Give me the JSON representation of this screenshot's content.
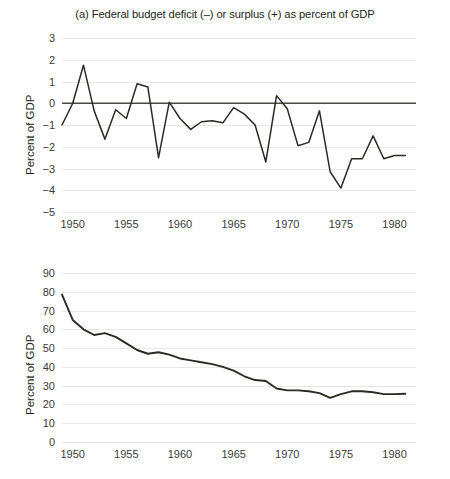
{
  "figure": {
    "panels": [
      {
        "id": "a",
        "title": "(a) Federal budget deficit (–) or surplus (+) as percent of GDP",
        "ylabel": "Percent of GDP"
      },
      {
        "id": "b",
        "title": "(b) National debt as percent of GDP",
        "ylabel": "Percent of GDP"
      }
    ]
  },
  "chart_data": [
    {
      "type": "line",
      "panel": "a",
      "title": "(a) Federal budget deficit (–) or surplus (+) as percent of GDP",
      "xlabel": "",
      "ylabel": "Percent of GDP",
      "xlim": [
        1949,
        1982
      ],
      "ylim": [
        -5,
        3
      ],
      "grid": true,
      "legend": "none",
      "yticks": [
        3,
        2,
        1,
        0,
        -1,
        -2,
        -3,
        -4,
        -5
      ],
      "yticklabels": [
        "3",
        "2",
        "1",
        "0",
        "−1",
        "−2",
        "−3",
        "−4",
        "−5"
      ],
      "xticks": [
        1950,
        1955,
        1960,
        1965,
        1970,
        1975,
        1980
      ],
      "xticklabels": [
        "1950",
        "1955",
        "1960",
        "1965",
        "1970",
        "1975",
        "1980"
      ],
      "annotations": [
        "zero reference line drawn at y = 0"
      ],
      "x": [
        1949,
        1950,
        1951,
        1952,
        1953,
        1954,
        1955,
        1956,
        1957,
        1958,
        1959,
        1960,
        1961,
        1962,
        1963,
        1964,
        1965,
        1966,
        1967,
        1968,
        1969,
        1970,
        1971,
        1972,
        1973,
        1974,
        1975,
        1976,
        1977,
        1978,
        1979,
        1980,
        1981
      ],
      "values": [
        -1.0,
        0.0,
        1.75,
        -0.35,
        -1.65,
        -0.3,
        -0.7,
        0.9,
        0.75,
        -2.5,
        0.05,
        -0.7,
        -1.2,
        -0.85,
        -0.8,
        -0.9,
        -0.2,
        -0.5,
        -1.0,
        -2.7,
        0.35,
        -0.25,
        -1.95,
        -1.8,
        -0.35,
        -3.15,
        -3.9,
        -2.55,
        -2.55,
        -1.5,
        -2.55,
        -2.4,
        -2.4
      ]
    },
    {
      "type": "line",
      "panel": "b",
      "title": "(b) National debt as percent of GDP",
      "xlabel": "",
      "ylabel": "Percent of GDP",
      "xlim": [
        1949,
        1982
      ],
      "ylim": [
        0,
        90
      ],
      "grid": true,
      "legend": "none",
      "yticks": [
        90,
        80,
        70,
        60,
        50,
        40,
        30,
        20,
        10,
        0
      ],
      "yticklabels": [
        "90",
        "80",
        "70",
        "60",
        "50",
        "40",
        "30",
        "20",
        "10",
        "0"
      ],
      "xticks": [
        1950,
        1955,
        1960,
        1965,
        1970,
        1975,
        1980
      ],
      "xticklabels": [
        "1950",
        "1955",
        "1960",
        "1965",
        "1970",
        "1975",
        "1980"
      ],
      "x": [
        1949,
        1950,
        1951,
        1952,
        1953,
        1954,
        1955,
        1956,
        1957,
        1958,
        1959,
        1960,
        1961,
        1962,
        1963,
        1964,
        1965,
        1966,
        1967,
        1968,
        1969,
        1970,
        1971,
        1972,
        1973,
        1974,
        1975,
        1976,
        1977,
        1978,
        1979,
        1980,
        1981
      ],
      "values": [
        78.5,
        65.0,
        60.0,
        57.0,
        58.0,
        56.0,
        52.5,
        49.0,
        47.0,
        47.8,
        46.5,
        44.5,
        43.5,
        42.5,
        41.5,
        40.0,
        38.0,
        35.0,
        33.0,
        32.5,
        28.5,
        27.5,
        27.5,
        27.0,
        26.0,
        23.5,
        25.5,
        27.0,
        27.0,
        26.5,
        25.5,
        25.5,
        25.7
      ]
    }
  ]
}
